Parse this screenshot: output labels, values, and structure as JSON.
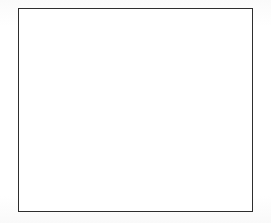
{
  "page": {
    "title": "Blank grid sheet",
    "width": 271,
    "height": 223,
    "background_color": "#ffffff",
    "has_text": false,
    "has_labels": false
  },
  "grid": {
    "name": "graph-paper-grid",
    "left": 18,
    "top": 8,
    "width": 235,
    "height": 204,
    "columns": 23,
    "rows": 20,
    "cell_width": 10.22,
    "cell_height": 10.2,
    "line_color": "#3c3c3c",
    "halo_color": "#b8b8b8",
    "border_color": "#2e2e2e",
    "border_width": 1.4,
    "line_width": 1,
    "fill_color": "#ffffff"
  },
  "chart_data": {
    "type": "table",
    "title": "",
    "subtitle": "",
    "xlabel": "",
    "ylabel": "",
    "categories": [],
    "values": [],
    "series": [],
    "grid": true,
    "legend": "none",
    "axis_ticks_visible": false,
    "note": "Empty grid / graph paper. No plotted data series, no tick labels, no annotations are present in the image.",
    "grid_columns": 23,
    "grid_rows": 20,
    "xlim": [
      0,
      23
    ],
    "ylim": [
      0,
      20
    ]
  }
}
